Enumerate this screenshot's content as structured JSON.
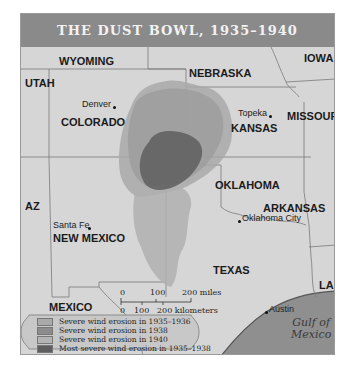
{
  "title": "THE DUST BOWL, 1935–1940",
  "states": {
    "wyoming": "WYOMING",
    "nebraska": "NEBRASKA",
    "iowa": "IOWA",
    "utah": "UTAH",
    "colorado": "COLORADO",
    "kansas": "KANSAS",
    "missouri": "MISSOURI",
    "oklahoma": "OKLAHOMA",
    "arkansas": "ARKANSAS",
    "arizona": "AZ",
    "new_mexico": "NEW MEXICO",
    "texas": "TEXAS",
    "louisiana": "LA",
    "mexico": "MEXICO"
  },
  "cities": {
    "denver": "Denver",
    "topeka": "Topeka",
    "santa_fe": "Santa Fe",
    "oklahoma_city": "Oklahoma City",
    "austin": "Austin"
  },
  "water": {
    "gulf_line1": "Gulf of",
    "gulf_line2": "Mexico"
  },
  "scale": {
    "miles_0": "0",
    "miles_100": "100",
    "miles_200": "200 miles",
    "km_0": "0",
    "km_100": "100",
    "km_200": "200 kilometers"
  },
  "legend": [
    {
      "label": "Severe wind erosion in 1935–1936",
      "color": "#a9a9a9"
    },
    {
      "label": "Severe wind erosion in 1938",
      "color": "#8c8c8c"
    },
    {
      "label": "Severe wind erosion in 1940",
      "color": "#b4b4b4"
    },
    {
      "label": "Most severe wind erosion in 1935–1938",
      "color": "#5e5e5e"
    }
  ],
  "colors": {
    "title_bg": "#8a8a8a",
    "land": "#d4d4d4",
    "water": "#8f8f8f"
  }
}
